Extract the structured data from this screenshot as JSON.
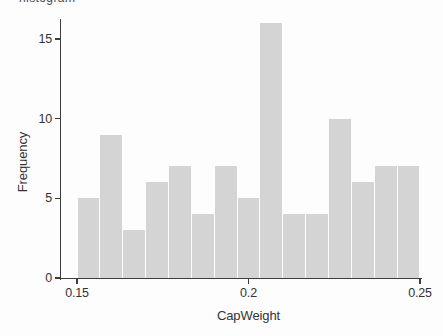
{
  "figure": {
    "cropped_top_text": "histogram"
  },
  "chart_data": {
    "type": "bar",
    "variant": "histogram",
    "title": "",
    "xlabel": "CapWeight",
    "ylabel": "Frequency",
    "x_range": [
      0.15,
      0.25
    ],
    "num_bins": 15,
    "bin_width": 0.006667,
    "values": [
      5,
      9,
      3,
      6,
      7,
      4,
      7,
      5,
      16,
      4,
      4,
      10,
      6,
      7,
      7
    ],
    "total_count": 100,
    "x_ticks": [
      {
        "value": 0.15,
        "label": "0.15"
      },
      {
        "value": 0.2,
        "label": "0.2"
      },
      {
        "value": 0.25,
        "label": "0.25"
      }
    ],
    "y_ticks": [
      {
        "value": 0,
        "label": "0"
      },
      {
        "value": 5,
        "label": "5"
      },
      {
        "value": 10,
        "label": "10"
      },
      {
        "value": 15,
        "label": "15"
      }
    ],
    "ylim": [
      0,
      16.3
    ],
    "grid": false,
    "legend": "none",
    "bar_color": "#d4d4d4",
    "bar_gap_color": "#ffffff",
    "axis_color": "#3d3d3d",
    "text_color": "#333333",
    "background_color": "#fdfdfd"
  }
}
